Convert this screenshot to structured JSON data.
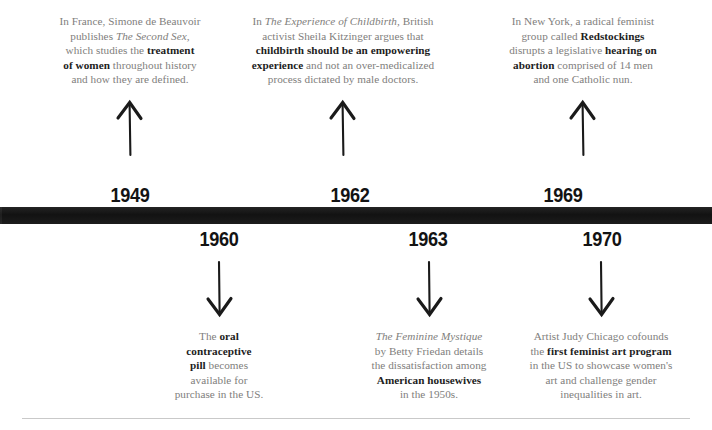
{
  "chart_data": {
    "type": "timeline",
    "title": "",
    "orientation": "horizontal",
    "axis_style": "black-bar",
    "events": [
      {
        "year": "1949",
        "side": "above",
        "arrow": "up",
        "text": "In France, Simone de Beauvoir publishes The Second Sex, which studies the treatment of women throughout history and how they are defined.",
        "emphasis": [
          "treatment of women"
        ],
        "italic": [
          "The Second Sex"
        ]
      },
      {
        "year": "1960",
        "side": "below",
        "arrow": "down",
        "text": "The oral contraceptive pill becomes available for purchase in the US.",
        "emphasis": [
          "oral contraceptive pill"
        ],
        "italic": []
      },
      {
        "year": "1962",
        "side": "above",
        "arrow": "up",
        "text": "In The Experience of Childbirth, British activist Sheila Kitzinger argues that childbirth should be an empowering experience and not an over-medicalized process dictated by male doctors.",
        "emphasis": [
          "childbirth should be an empowering experience"
        ],
        "italic": [
          "The Experience of Childbirth"
        ]
      },
      {
        "year": "1963",
        "side": "below",
        "arrow": "down",
        "text": "The Feminine Mystique by Betty Friedan details the dissatisfaction among American housewives in the 1950s.",
        "emphasis": [
          "American housewives"
        ],
        "italic": [
          "The Feminine Mystique"
        ]
      },
      {
        "year": "1969",
        "side": "above",
        "arrow": "up",
        "text": "In New York, a radical feminist group called Redstockings disrupts a legislative hearing on abortion comprised of 14 men and one Catholic nun.",
        "emphasis": [
          "Redstockings",
          "hearing on abortion"
        ],
        "italic": []
      },
      {
        "year": "1970",
        "side": "below",
        "arrow": "down",
        "text": "Artist Judy Chicago cofounds the first feminist art program in the US to showcase women's art and challenge gender inequalities in art.",
        "emphasis": [
          "first feminist art program"
        ],
        "italic": []
      }
    ]
  },
  "years": {
    "above": [
      "1949",
      "1962",
      "1969"
    ],
    "below": [
      "1960",
      "1963",
      "1970"
    ]
  },
  "blurbs": {
    "e1_html": "In France, Simone de Beauvoir<br>publishes <i>The Second Sex,</i><br>which studies the <b>treatment</b><br><b>of women</b> throughout history<br>and how they are defined.",
    "e2_html": "In <i>The Experience of Childbirth,</i> British<br>activist Sheila Kitzinger argues that<br><b>childbirth should be an empowering</b><br><b>experience</b> and not an over-medicalized<br>process dictated by male doctors.",
    "e3_html": "In New York, a radical feminist<br>group called <b>Redstockings</b><br>disrupts a legislative <b>hearing on</b><br><b>abortion</b> comprised of 14 men<br>and one Catholic nun.",
    "e4_html": "The <b>oral</b><br><b>contraceptive</b><br><b>pill</b> becomes<br>available for<br>purchase in the US.",
    "e5_html": "<i>The Feminine Mystique</i><br>by Betty Friedan details<br>the dissatisfaction among<br><b>American housewives</b><br>in the 1950s.",
    "e6_html": "Artist Judy Chicago cofounds<br>the <b>first feminist art program</b><br>in the US to showcase women's<br>art and challenge gender<br>inequalities in art."
  },
  "colors": {
    "bar": "#171717",
    "body_text": "#807e7c",
    "emphasis_text": "#1d1d1d",
    "year_text": "#131313",
    "rule": "#c9c9c9",
    "background": "#ffffff"
  }
}
